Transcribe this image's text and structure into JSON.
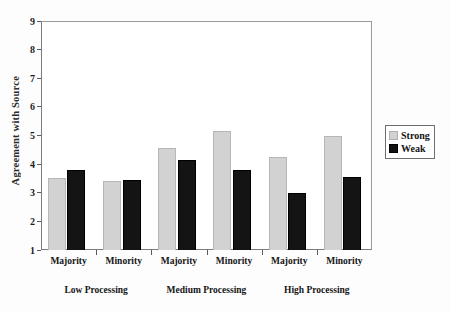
{
  "chart_data": {
    "type": "bar",
    "title": "",
    "xlabel": "",
    "ylabel": "Agreement with Source",
    "ylim": [
      1,
      9
    ],
    "yticks": [
      1,
      2,
      3,
      4,
      5,
      6,
      7,
      8,
      9
    ],
    "grid": false,
    "legend_position": "right",
    "categories": [
      "Majority",
      "Minority",
      "Majority",
      "Minority",
      "Majority",
      "Minority"
    ],
    "groups": [
      {
        "label": "Low Processing",
        "categories": [
          "Majority",
          "Minority"
        ]
      },
      {
        "label": "Medium Processing",
        "categories": [
          "Majority",
          "Minority"
        ]
      },
      {
        "label": "High Processing",
        "categories": [
          "Majority",
          "Minority"
        ]
      }
    ],
    "series": [
      {
        "name": "Strong",
        "color": "#d2d2d2",
        "values": [
          3.5,
          3.4,
          4.55,
          5.15,
          4.25,
          5.0
        ]
      },
      {
        "name": "Weak",
        "color": "#141414",
        "values": [
          3.8,
          3.45,
          4.15,
          3.8,
          3.0,
          3.55
        ]
      }
    ]
  },
  "legend": {
    "items": [
      {
        "label": "Strong",
        "swatch": "strong"
      },
      {
        "label": "Weak",
        "swatch": "weak"
      }
    ]
  }
}
